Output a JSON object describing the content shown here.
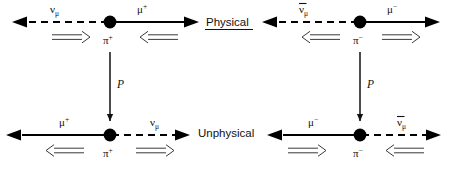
{
  "figure": {
    "background_color": "#ffffff",
    "ink_color": "#000000",
    "spin_arrow_color": "#3a3a3a"
  },
  "region_labels": {
    "physical": "Physical",
    "physical_underlined": true,
    "unphysical": "Unphysical",
    "unphysical_underlined": false
  },
  "operator": {
    "symbol": "P",
    "meaning": "parity",
    "direction": "downward"
  },
  "particles": {
    "neutrino": "ν",
    "neutrino_sub": "μ",
    "antineutrino": "ν",
    "antineutrino_sub": "μ",
    "antineutrino_bar": true,
    "muon": "μ",
    "muon_plus_sup": "+",
    "muon_minus_sup": "−",
    "pion": "π",
    "pion_plus_sup": "+",
    "pion_minus_sup": "−"
  },
  "panels": [
    {
      "id": "top-left",
      "row": "physical",
      "column": "left",
      "vertex_label": "π",
      "vertex_sup": "+",
      "left_particle": {
        "symbol": "ν",
        "sub": "μ",
        "bar": false,
        "line": "dashed",
        "momentum": "left"
      },
      "right_particle": {
        "symbol": "μ",
        "sup": "+",
        "bar": false,
        "line": "solid",
        "momentum": "right"
      },
      "left_spin": "right",
      "right_spin": "left"
    },
    {
      "id": "top-right",
      "row": "physical",
      "column": "right",
      "vertex_label": "π",
      "vertex_sup": "−",
      "left_particle": {
        "symbol": "ν",
        "sub": "μ",
        "bar": true,
        "line": "dashed",
        "momentum": "left"
      },
      "right_particle": {
        "symbol": "μ",
        "sup": "−",
        "bar": false,
        "line": "solid",
        "momentum": "right"
      },
      "left_spin": "left",
      "right_spin": "right"
    },
    {
      "id": "bottom-left",
      "row": "unphysical",
      "column": "left",
      "vertex_label": "π",
      "vertex_sup": "+",
      "left_particle": {
        "symbol": "μ",
        "sup": "+",
        "bar": false,
        "line": "solid",
        "momentum": "left"
      },
      "right_particle": {
        "symbol": "ν",
        "sub": "μ",
        "bar": false,
        "line": "dashed",
        "momentum": "right"
      },
      "left_spin": "left",
      "right_spin": "right"
    },
    {
      "id": "bottom-right",
      "row": "unphysical",
      "column": "right",
      "vertex_label": "π",
      "vertex_sup": "−",
      "left_particle": {
        "symbol": "μ",
        "sup": "−",
        "bar": false,
        "line": "solid",
        "momentum": "left"
      },
      "right_particle": {
        "symbol": "ν",
        "sub": "μ",
        "bar": true,
        "line": "dashed",
        "momentum": "right"
      },
      "left_spin": "right",
      "right_spin": "left"
    }
  ]
}
